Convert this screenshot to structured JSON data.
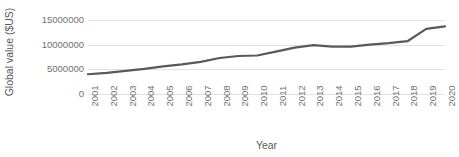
{
  "chart_data": {
    "type": "line",
    "title": "",
    "subtitle": "",
    "xlabel": "Year",
    "ylabel": "Global value ($US)",
    "x": [
      2001,
      2002,
      2003,
      2004,
      2005,
      2006,
      2007,
      2008,
      2009,
      2010,
      2011,
      2012,
      2013,
      2014,
      2015,
      2016,
      2017,
      2018,
      2019,
      2020
    ],
    "categories": [
      "2001",
      "2002",
      "2003",
      "2004",
      "2005",
      "2006",
      "2007",
      "2008",
      "2009",
      "2010",
      "2011",
      "2012",
      "2013",
      "2014",
      "2015",
      "2016",
      "2017",
      "2018",
      "2019",
      "2020"
    ],
    "values": [
      4000000,
      4300000,
      4700000,
      5100000,
      5600000,
      6000000,
      6500000,
      7300000,
      7700000,
      7800000,
      8600000,
      9400000,
      9900000,
      9600000,
      9600000,
      10000000,
      10300000,
      10700000,
      13200000,
      13700000
    ],
    "series": [
      {
        "name": "Global value",
        "color": "#595959",
        "values": [
          4000000,
          4300000,
          4700000,
          5100000,
          5600000,
          6000000,
          6500000,
          7300000,
          7700000,
          7800000,
          8600000,
          9400000,
          9900000,
          9600000,
          9600000,
          10000000,
          10300000,
          10700000,
          13200000,
          13700000
        ]
      }
    ],
    "ylim": [
      0,
      15000000
    ],
    "yticks": [
      0,
      5000000,
      10000000,
      15000000
    ],
    "ytick_labels": [
      "0",
      "5000000",
      "10000000",
      "15000000"
    ],
    "xlim": [
      2001,
      2020
    ],
    "grid": "horizontal",
    "legend": "none",
    "line_color": "#595959",
    "line_width": 2.2,
    "markers": "none",
    "background_color": "#ffffff",
    "gridline_color": "#e2e2e2",
    "axis_text_color": "#707070",
    "title_text_color": "#595959"
  }
}
